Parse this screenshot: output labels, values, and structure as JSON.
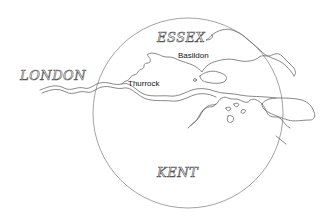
{
  "map": {
    "title": "Thames estuary locator map",
    "regions": [
      {
        "id": "london",
        "label": "LONDON"
      },
      {
        "id": "essex",
        "label": "ESSEX"
      },
      {
        "id": "kent",
        "label": "KENT"
      }
    ],
    "towns": [
      {
        "id": "basildon",
        "label": "Basildon"
      },
      {
        "id": "thurrock",
        "label": "Thurrock"
      }
    ],
    "colors": {
      "background": "#ffffff",
      "outline": "#6a6a6a",
      "circle": "#8a8a8a",
      "text": "#111111"
    }
  }
}
